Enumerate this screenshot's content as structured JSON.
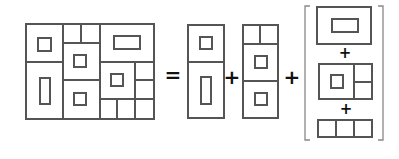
{
  "diagram": {
    "title": "",
    "stroke_color": "#555555",
    "operators": {
      "equals": "=",
      "plus_1": "+",
      "plus_2": "+",
      "bracket_plus_1": "+",
      "bracket_plus_2": "+"
    },
    "parts": [
      {
        "id": "composite",
        "label": "full layout (3 columns, nested rooms)"
      },
      {
        "id": "left-column",
        "label": "left column: two stacked rooms"
      },
      {
        "id": "middle-column",
        "label": "middle column: split strip + two rooms"
      },
      {
        "id": "right-column-group",
        "label": "bracketed group: top room + room with side cells + three-cell strip"
      }
    ]
  }
}
